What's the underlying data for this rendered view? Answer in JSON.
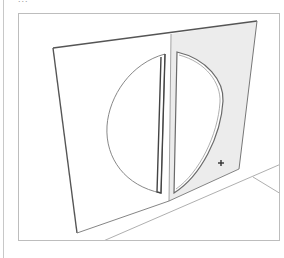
{
  "caption": {
    "text": "..."
  },
  "viewport": {
    "description": "3D modeling viewport showing a flat panel with a circular cutout split into two halves",
    "colors": {
      "background": "#ffffff",
      "edge": "#555555",
      "thin_edge": "#8a8a8a",
      "selected_face": "#ececec",
      "frame": "#bdbdbd"
    }
  },
  "scene": {
    "left_panel": {
      "label": "left-face",
      "selected": false
    },
    "right_panel": {
      "label": "right-face",
      "selected": true
    },
    "cursor": {
      "type": "move-cursor",
      "x": 220,
      "y": 162
    }
  }
}
